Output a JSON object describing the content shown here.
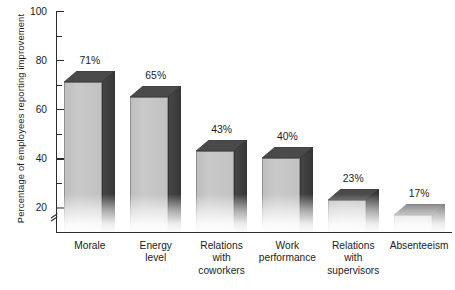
{
  "chart_data": {
    "type": "bar",
    "title": "",
    "subtitle": "",
    "xlabel": "",
    "ylabel": "Percentage of employees reporting improvement",
    "categories": [
      "Morale",
      "Energy\nlevel",
      "Relations\nwith\ncoworkers",
      "Work\nperformance",
      "Relations\nwith\nsupervisors",
      "Absenteeism"
    ],
    "values": [
      71,
      65,
      43,
      40,
      23,
      17
    ],
    "data_labels": [
      "71%",
      "65%",
      "43%",
      "40%",
      "23%",
      "17%"
    ],
    "ylim": [
      10,
      100
    ],
    "y_major_ticks": [
      100,
      80,
      60,
      40,
      20
    ],
    "y_minor_ticks": [
      90,
      70,
      50,
      30
    ],
    "y_tick_labels": [
      "100",
      "80",
      "60",
      "40",
      "20"
    ],
    "axis_break": true,
    "grid": false,
    "legend": false,
    "style_3d": true,
    "colors": {
      "bar_front": "#c6c6c6",
      "bar_side": "#454545",
      "bar_top": "#4a4a4a",
      "axis": "#2b2b2b",
      "text": "#1c1c1c",
      "background": "#ffffff"
    }
  },
  "axis": {
    "y_title": "Percentage of employees reporting improvement"
  }
}
